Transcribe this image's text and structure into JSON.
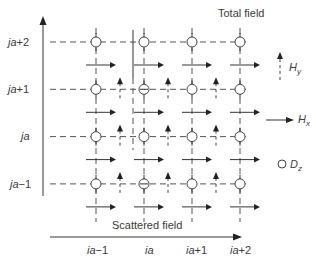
{
  "diagram": {
    "title_top": "Total field",
    "title_bottom": "Scattered field",
    "x_labels": [
      "ia−1",
      "ia",
      "ia+1",
      "ia+2"
    ],
    "x_label_parts": [
      {
        "italic": "ia",
        "suffix": "−1"
      },
      {
        "italic": "ia",
        "suffix": ""
      },
      {
        "italic": "ia",
        "suffix": "+1"
      },
      {
        "italic": "ia",
        "suffix": "+2"
      }
    ],
    "y_labels": [
      "ja+2",
      "ja+1",
      "ja",
      "ja−1"
    ],
    "y_label_parts": [
      {
        "italic": "ja",
        "suffix": "+2"
      },
      {
        "italic": "ja",
        "suffix": "+1"
      },
      {
        "italic": "ja",
        "suffix": ""
      },
      {
        "italic": "ja",
        "suffix": "−1"
      }
    ],
    "legend": [
      {
        "symbol": "dashed-up-arrow",
        "label_main": "H",
        "label_sub": "y"
      },
      {
        "symbol": "right-arrow",
        "label_main": "H",
        "label_sub": "x"
      },
      {
        "symbol": "circle",
        "label_main": "D",
        "label_sub": "z"
      }
    ],
    "grid": {
      "columns": 4,
      "rows": 4
    },
    "colors": {
      "line": "#444444",
      "text": "#3a3a3a",
      "background": "#ffffff"
    }
  }
}
